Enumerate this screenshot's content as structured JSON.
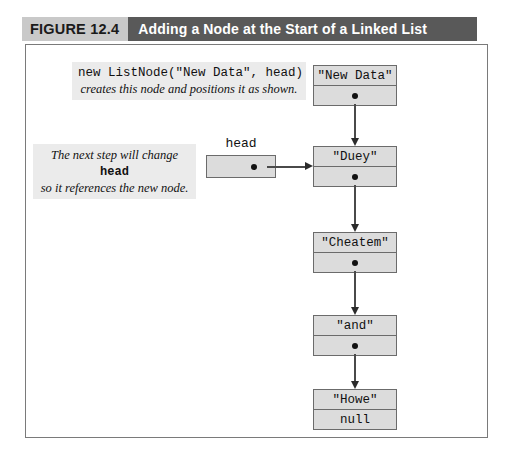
{
  "figure": {
    "number_label": "FIGURE 12.4",
    "title": "Adding a Node at the Start of a Linked List"
  },
  "annotations": [
    {
      "id": "new-node",
      "code_line": "new ListNode(\"New Data\", head)",
      "italic_line": "creates this node and positions it as shown."
    },
    {
      "id": "head-change",
      "italic_line_1_prefix": "The next step will change ",
      "italic_line_1_mono": "head",
      "italic_line_2": "so it references the new node."
    }
  ],
  "pointer_variable": {
    "label": "head",
    "value_icon": "pointer-dot-icon"
  },
  "nodes": [
    {
      "id": "new-data",
      "data": "\"New Data\"",
      "link": "",
      "link_icon": "pointer-dot-icon"
    },
    {
      "id": "duey",
      "data": "\"Duey\"",
      "link": "",
      "link_icon": "pointer-dot-icon"
    },
    {
      "id": "cheatem",
      "data": "\"Cheatem\"",
      "link": "",
      "link_icon": "pointer-dot-icon"
    },
    {
      "id": "and",
      "data": "\"and\"",
      "link": "",
      "link_icon": "pointer-dot-icon"
    },
    {
      "id": "howe",
      "data": "\"Howe\"",
      "link": "null",
      "link_icon": ""
    }
  ],
  "colors": {
    "caption_number_bg": "#c9c9c9",
    "caption_title_bg": "#595959",
    "node_fill": "#dcdcdc",
    "node_border": "#6b6b6b",
    "annotation_bg": "#ebebeb",
    "frame_border": "#7a7a7a",
    "arrow": "#2b2b2b"
  }
}
